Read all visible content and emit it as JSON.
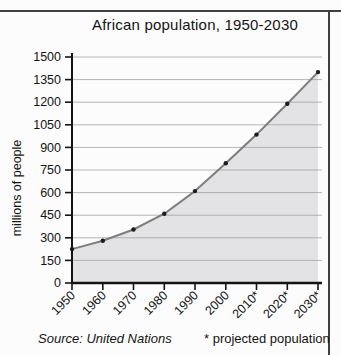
{
  "chart_data": {
    "type": "area",
    "title": "African population, 1950-2030",
    "xlabel": "",
    "ylabel": "millions of people",
    "categories": [
      "1950",
      "1960",
      "1970",
      "1980",
      "1990",
      "2000",
      "2010*",
      "2020*",
      "2030*"
    ],
    "values": [
      225,
      280,
      355,
      460,
      610,
      795,
      985,
      1190,
      1400
    ],
    "ylim": [
      0,
      1500
    ],
    "yticks": [
      0,
      150,
      300,
      450,
      600,
      750,
      900,
      1050,
      1200,
      1350,
      1500
    ],
    "grid": true,
    "legend_position": "none",
    "markers": "filled-dots"
  },
  "footer": {
    "source_label": "Source: United Nations",
    "projection_note": "* projected population"
  },
  "colors": {
    "background": "#fcfcfc",
    "area_fill": "#e3e3e6",
    "curve_line": "#7d7d7d",
    "point": "#1c1c1c",
    "gridline": "#9e9e9e",
    "axis": "#141414",
    "text": "#141414",
    "frame": "#3f3f3f"
  }
}
